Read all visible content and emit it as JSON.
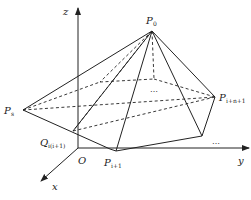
{
  "figure": {
    "type": "3d-pyramid-diagram",
    "axes": {
      "x_label": "x",
      "y_label": "y",
      "z_label": "z",
      "origin_label": "O"
    },
    "points": {
      "apex": {
        "name": "P",
        "sub": "0"
      },
      "left": {
        "name": "P",
        "sub": "s"
      },
      "right": {
        "name": "P",
        "sub": "i+n+1"
      },
      "bottom": {
        "name": "P",
        "sub": "i+1"
      },
      "q": {
        "name": "Q",
        "sub": "i(i+1)"
      }
    },
    "ellipsis_center": "…",
    "ellipsis_right": "…",
    "caption": ""
  }
}
